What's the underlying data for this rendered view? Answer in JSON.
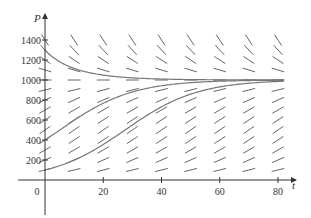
{
  "chart_data": {
    "type": "line",
    "title": "",
    "subtitle": "Direction field for a logistic equation with three solution curves",
    "xlabel": "t",
    "ylabel": "P",
    "xlim": [
      0,
      85
    ],
    "ylim": [
      0,
      1500
    ],
    "x_ticks": [
      0,
      20,
      40,
      60,
      80
    ],
    "x_tick_labels": [
      "0",
      "20",
      "40",
      "60",
      "80"
    ],
    "y_ticks": [
      200,
      400,
      600,
      800,
      1000,
      1200,
      1400
    ],
    "y_tick_labels": [
      "200",
      "400",
      "600",
      "800",
      "1000",
      "1200",
      "1400"
    ],
    "grid": false,
    "legend": null,
    "direction_field": {
      "equation": "dP/dt = kP(1 - P/M)",
      "k": 0.08,
      "M": 1000,
      "t_values": [
        0,
        10,
        20,
        30,
        40,
        50,
        60,
        70,
        80
      ],
      "P_values": [
        100,
        200,
        300,
        400,
        500,
        600,
        700,
        800,
        900,
        1000,
        1100,
        1200,
        1300,
        1400
      ]
    },
    "series": [
      {
        "name": "solution P(0)=1300",
        "P0": 1300,
        "k": 0.08,
        "M": 1000,
        "x": [
          0,
          10,
          20,
          30,
          40,
          50,
          60,
          70,
          80
        ],
        "values": [
          1300,
          1085,
          1020,
          1005,
          1001,
          1000,
          1000,
          1000,
          1000
        ]
      },
      {
        "name": "solution P(0)=400",
        "P0": 400,
        "k": 0.08,
        "M": 1000,
        "x": [
          0,
          10,
          20,
          30,
          40,
          50,
          60,
          70,
          80
        ],
        "values": [
          400,
          597,
          767,
          880,
          943,
          974,
          988,
          995,
          998
        ]
      },
      {
        "name": "solution P(0)=100",
        "P0": 100,
        "k": 0.08,
        "M": 1000,
        "x": [
          0,
          10,
          20,
          30,
          40,
          50,
          60,
          70,
          80
        ],
        "values": [
          100,
          198,
          354,
          550,
          731,
          859,
          932,
          968,
          985
        ]
      }
    ]
  },
  "axes": {
    "x_label": "t",
    "y_label": "P",
    "x_tick_labels": [
      "0",
      "20",
      "40",
      "60",
      "80"
    ],
    "y_tick_labels": [
      "200",
      "400",
      "600",
      "800",
      "1000",
      "1200",
      "1400"
    ]
  },
  "style": {
    "curve_color": "#777777",
    "segment_color": "#555555",
    "axis_color": "#333333"
  }
}
